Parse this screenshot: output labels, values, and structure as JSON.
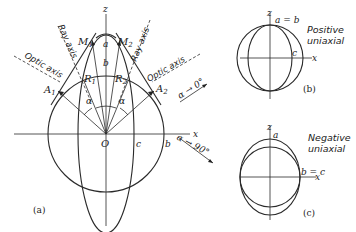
{
  "figure": {
    "panel_a": {
      "label": "(a)",
      "axis_x": "x",
      "axis_z": "z",
      "origin": "O",
      "point_labels": {
        "M1": "M",
        "M1_sub": "1",
        "M2": "M",
        "M2_sub": "2",
        "R1": "R",
        "R1_sub": "1",
        "R2": "R",
        "R2_sub": "2",
        "A1": "A",
        "A1_sub": "1",
        "A2": "A",
        "A2_sub": "2"
      },
      "semi_axis_labels": {
        "a": "a",
        "b_top": "b",
        "b_right": "b",
        "c": "c"
      },
      "angle_label": "α",
      "ray_axis_label": "Ray axis",
      "optic_axis_label": "Optic axis",
      "limit_0": "α → 0°",
      "limit_90": "α → 90°"
    },
    "panel_b": {
      "label": "(b)",
      "axis_x": "x",
      "axis_z": "z",
      "top_label": "a = b",
      "side_label": "c",
      "caption_line1": "Positive",
      "caption_line2": "uniaxial"
    },
    "panel_c": {
      "label": "(c)",
      "axis_x": "x",
      "axis_z": "z",
      "top_label": "a",
      "side_label": "b = c",
      "caption_line1": "Negative",
      "caption_line2": "uniaxial"
    }
  }
}
